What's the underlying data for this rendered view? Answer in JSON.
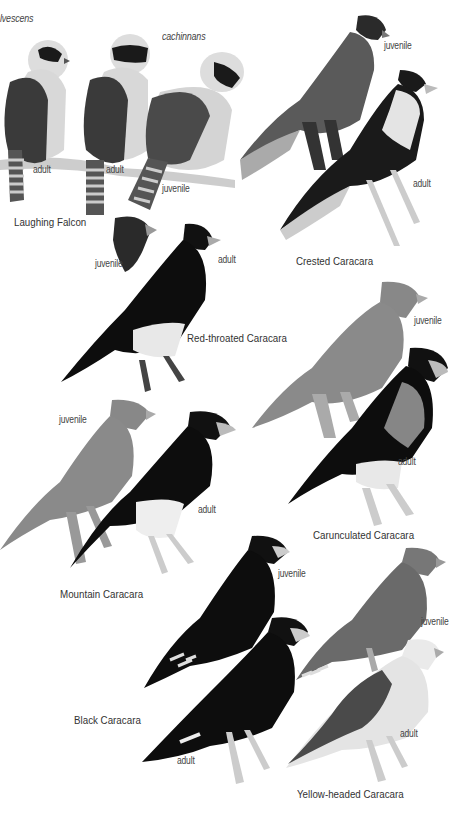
{
  "plate": {
    "species": [
      {
        "name": "Laughing Falcon",
        "subspecies": [
          "fulvescens",
          "cachinnans"
        ],
        "birds": [
          {
            "age": "adult",
            "subspecies": "fulvescens"
          },
          {
            "age": "adult",
            "subspecies": "cachinnans"
          },
          {
            "age": "juvenile",
            "subspecies": "cachinnans"
          }
        ]
      },
      {
        "name": "Crested Caracara",
        "birds": [
          {
            "age": "juvenile"
          },
          {
            "age": "adult"
          }
        ]
      },
      {
        "name": "Red-throated Caracara",
        "birds": [
          {
            "age": "juvenile"
          },
          {
            "age": "adult"
          }
        ]
      },
      {
        "name": "Carunculated Caracara",
        "birds": [
          {
            "age": "juvenile"
          },
          {
            "age": "adult"
          }
        ]
      },
      {
        "name": "Mountain Caracara",
        "birds": [
          {
            "age": "juvenile"
          },
          {
            "age": "adult"
          }
        ]
      },
      {
        "name": "Black Caracara",
        "birds": [
          {
            "age": "juvenile"
          },
          {
            "age": "adult"
          }
        ]
      },
      {
        "name": "Yellow-headed Caracara",
        "birds": [
          {
            "age": "juvenile"
          },
          {
            "age": "adult"
          }
        ]
      }
    ],
    "subspecies_labels": {
      "a": "lvescens",
      "b": "cachinnans"
    },
    "age_labels": {
      "adult": "adult",
      "juvenile": "juvenile"
    }
  }
}
